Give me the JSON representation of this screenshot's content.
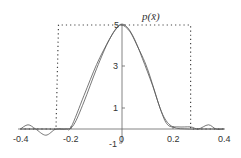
{
  "chart_data": {
    "type": "line",
    "title": "p(x̄)",
    "xlabel": "",
    "ylabel": "",
    "xlim": [
      -0.4,
      0.4
    ],
    "ylim": [
      -1,
      5
    ],
    "x_ticks": [
      "-0.4",
      "-0.2",
      "0",
      "0.2",
      "0.4"
    ],
    "y_ticks": [
      "5",
      "3",
      "1",
      "-1"
    ],
    "grid": false,
    "legend": null,
    "series": [
      {
        "name": "uniform (dotted)",
        "style": "dotted",
        "x": [
          -0.4,
          -0.26,
          -0.26,
          -0.25,
          0.27,
          0.27,
          0.4
        ],
        "y": [
          0,
          0,
          0,
          5,
          5,
          0,
          0
        ]
      },
      {
        "name": "estimate 1",
        "style": "solid",
        "x": [
          -0.4,
          -0.37,
          -0.34,
          -0.3,
          -0.26,
          -0.22,
          -0.2,
          -0.15,
          -0.1,
          -0.05,
          -0.02,
          0,
          0.03,
          0.06,
          0.1,
          0.15,
          0.18,
          0.22,
          0.27,
          0.3,
          0.34,
          0.37,
          0.4
        ],
        "y": [
          0,
          0.2,
          0,
          -0.3,
          0,
          0,
          0.1,
          1.6,
          3.1,
          4.3,
          4.85,
          5,
          4.7,
          4.0,
          2.9,
          1.0,
          0.2,
          0.1,
          0.1,
          0,
          0.2,
          0,
          0
        ]
      },
      {
        "name": "estimate 2",
        "style": "solid",
        "x": [
          -0.4,
          -0.3,
          -0.22,
          -0.19,
          -0.15,
          -0.1,
          -0.05,
          -0.01,
          0.02,
          0.05,
          0.08,
          0.12,
          0.16,
          0.2,
          0.26,
          0.3,
          0.4
        ],
        "y": [
          0,
          0,
          0,
          0.2,
          1.3,
          2.9,
          4.3,
          5,
          4.9,
          4.3,
          3.4,
          2.1,
          0.7,
          0.1,
          0,
          0,
          0
        ]
      }
    ]
  },
  "labels": {
    "title": "p(x̄)",
    "x_ticks": [
      "-0.4",
      "-0.2",
      "0",
      "0.2",
      "0.4"
    ],
    "y_ticks": [
      "5",
      "3",
      "1",
      "-1"
    ]
  }
}
